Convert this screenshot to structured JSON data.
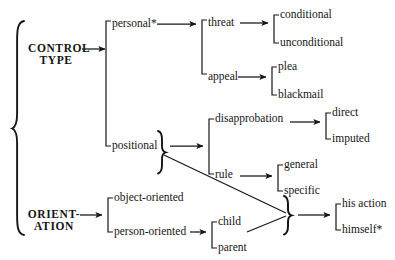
{
  "diagram": {
    "type": "tree-taxonomy",
    "title": "",
    "roots": [
      {
        "id": "control-type",
        "label_line1": "CONTROL",
        "label_line2": "TYPE"
      },
      {
        "id": "orientation",
        "label_line1": "ORIENT-",
        "label_line2": "ATION"
      }
    ],
    "nodes": {
      "personal": "personal*",
      "positional": "positional",
      "threat": "threat",
      "appeal": "appeal",
      "conditional": "conditional",
      "unconditional": "unconditional",
      "plea": "plea",
      "blackmail": "blackmail",
      "disapprobation": "disapprobation",
      "rule": "rule",
      "direct": "direct",
      "imputed": "imputed",
      "general": "general",
      "specific": "specific",
      "object_oriented": "object-oriented",
      "person_oriented": "person-oriented",
      "child": "child",
      "parent": "parent",
      "his_action": "his action",
      "himself": "himself*"
    },
    "branches": [
      {
        "parent": "control-type",
        "children": [
          "personal",
          "positional"
        ]
      },
      {
        "parent": "personal",
        "children": [
          "threat",
          "appeal"
        ]
      },
      {
        "parent": "threat",
        "children": [
          "conditional",
          "unconditional"
        ]
      },
      {
        "parent": "appeal",
        "children": [
          "plea",
          "blackmail"
        ]
      },
      {
        "parent": "positional",
        "children": [
          "disapprobation",
          "rule"
        ]
      },
      {
        "parent": "disapprobation",
        "children": [
          "direct",
          "imputed"
        ]
      },
      {
        "parent": "rule",
        "children": [
          "general",
          "specific"
        ]
      },
      {
        "parent": "orientation",
        "children": [
          "object_oriented",
          "person_oriented"
        ]
      },
      {
        "parent": "person_oriented",
        "children": [
          "child",
          "parent"
        ]
      },
      {
        "parent": "merge",
        "children": [
          "his_action",
          "himself"
        ]
      }
    ],
    "colors": {
      "ink": "#161616",
      "background": "#fefefe"
    }
  }
}
